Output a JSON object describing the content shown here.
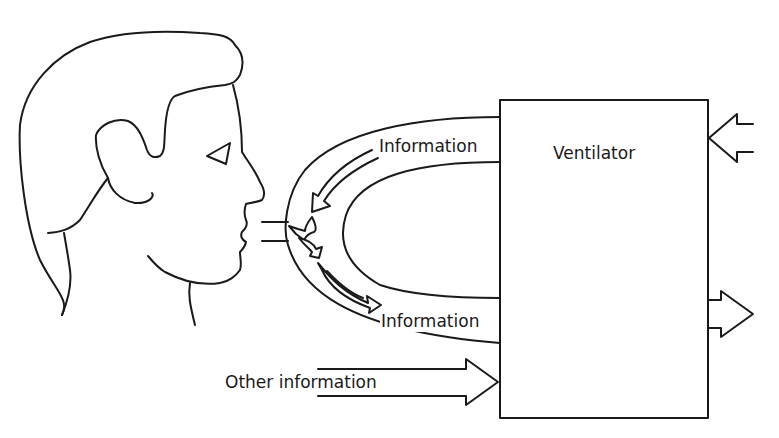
{
  "diagram": {
    "box": {
      "label": "Ventilator"
    },
    "loop_top_label": "Information",
    "loop_bottom_label": "Information",
    "other_input_label": "Other information",
    "nodes": [
      {
        "id": "patient",
        "kind": "head-profile-illustration"
      },
      {
        "id": "ventilator",
        "kind": "box",
        "label": "Ventilator"
      }
    ],
    "edges": [
      {
        "from": "ventilator",
        "to": "patient",
        "label": "Information"
      },
      {
        "from": "patient",
        "to": "ventilator",
        "label": "Information"
      },
      {
        "from": "external",
        "to": "ventilator",
        "label": "Other information"
      },
      {
        "from": "external-right",
        "to": "ventilator",
        "label": ""
      },
      {
        "from": "ventilator",
        "to": "output-right",
        "label": ""
      }
    ],
    "colors": {
      "line": "#1a1a1a",
      "background": "#ffffff"
    }
  }
}
